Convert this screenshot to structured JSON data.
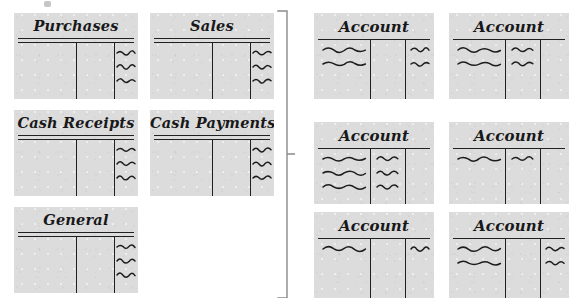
{
  "diagram": {
    "page_background": "#ffffff",
    "card_fill": "#dcdcdc",
    "ink_color": "#20201f",
    "brace_color": "#8a8a8a"
  },
  "journals": {
    "group_label": "Journals",
    "cards": [
      {
        "name": "purchases-journal",
        "title": "Purchases",
        "x": 14,
        "y": 13,
        "w": 124,
        "h": 86,
        "double_rule": true,
        "vrules": [
          50,
          81
        ],
        "entries": {
          "left": 0,
          "middle": 0,
          "right": 3
        }
      },
      {
        "name": "sales-journal",
        "title": "Sales",
        "x": 150,
        "y": 13,
        "w": 124,
        "h": 86,
        "double_rule": true,
        "vrules": [
          50,
          81
        ],
        "entries": {
          "left": 0,
          "middle": 0,
          "right": 3
        }
      },
      {
        "name": "cash-receipts-journal",
        "title": "Cash Receipts",
        "x": 14,
        "y": 110,
        "w": 124,
        "h": 86,
        "double_rule": true,
        "vrules": [
          50,
          81
        ],
        "entries": {
          "left": 0,
          "middle": 0,
          "right": 3
        }
      },
      {
        "name": "cash-payments-journal",
        "title": "Cash Payments",
        "x": 150,
        "y": 110,
        "w": 124,
        "h": 86,
        "double_rule": true,
        "vrules": [
          50,
          81
        ],
        "entries": {
          "left": 0,
          "middle": 0,
          "right": 3
        }
      },
      {
        "name": "general-journal",
        "title": "General",
        "x": 14,
        "y": 207,
        "w": 124,
        "h": 86,
        "double_rule": true,
        "vrules": [
          50,
          81
        ],
        "entries": {
          "left": 0,
          "middle": 0,
          "right": 3
        }
      }
    ]
  },
  "connector": {
    "name": "posting-brace",
    "shape": "right-facing-brace-with-center-tick",
    "x": 277,
    "y": 10,
    "w": 18,
    "h": 288
  },
  "ledger": {
    "group_label": "Ledger accounts",
    "cards": [
      {
        "name": "ledger-account-1",
        "title": "Account",
        "x": 314,
        "y": 13,
        "w": 120,
        "h": 86,
        "double_rule": false,
        "vrules": [
          47,
          76
        ],
        "entries": {
          "left": 2,
          "middle": 0,
          "right": 2
        }
      },
      {
        "name": "ledger-account-2",
        "title": "Account",
        "x": 449,
        "y": 13,
        "w": 120,
        "h": 86,
        "double_rule": false,
        "vrules": [
          47,
          76
        ],
        "entries": {
          "left": 2,
          "middle": 2,
          "right": 0
        }
      },
      {
        "name": "ledger-account-3",
        "title": "Account",
        "x": 314,
        "y": 122,
        "w": 120,
        "h": 82,
        "double_rule": false,
        "vrules": [
          47,
          76
        ],
        "entries": {
          "left": 3,
          "middle": 3,
          "right": 0
        }
      },
      {
        "name": "ledger-account-4",
        "title": "Account",
        "x": 449,
        "y": 122,
        "w": 120,
        "h": 82,
        "double_rule": false,
        "vrules": [
          47,
          76
        ],
        "entries": {
          "left": 1,
          "middle": 1,
          "right": 0
        }
      },
      {
        "name": "ledger-account-5",
        "title": "Account",
        "x": 314,
        "y": 212,
        "w": 120,
        "h": 86,
        "double_rule": false,
        "vrules": [
          47,
          76
        ],
        "entries": {
          "left": 1,
          "middle": 0,
          "right": 1
        }
      },
      {
        "name": "ledger-account-6",
        "title": "Account",
        "x": 449,
        "y": 212,
        "w": 120,
        "h": 86,
        "double_rule": false,
        "vrules": [
          47,
          76
        ],
        "entries": {
          "left": 2,
          "middle": 0,
          "right": 2
        }
      }
    ]
  },
  "artifacts": {
    "scan_speck": {
      "name": "scan-speck",
      "x": 44,
      "y": 1,
      "w": 7,
      "h": 6
    }
  }
}
